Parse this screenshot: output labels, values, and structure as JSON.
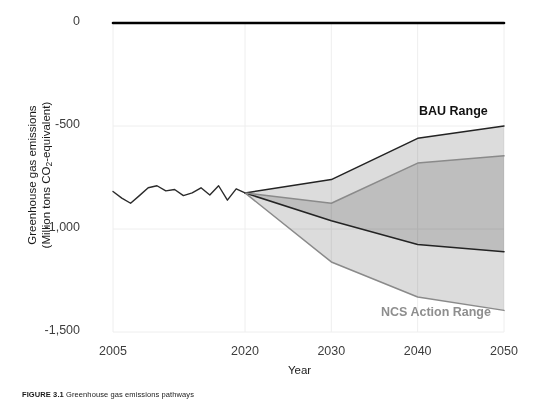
{
  "figure": {
    "caption_label": "FIGURE 3.1",
    "caption_body": " Greenhouse gas emissions pathways",
    "x_axis_title": "Year",
    "y_axis_title_line1": "Greenhouse gas emissions",
    "y_axis_title_line2_pre": "(Million tons CO",
    "y_axis_title_sub": "2",
    "y_axis_title_line2_post": "-equivalent)"
  },
  "colors": {
    "zero_line": "#000000",
    "historical_line": "#2b2b2b",
    "bau_outline": "#232323",
    "ncs_outline": "#8a8a8a",
    "band_light": "#dcdcdc",
    "band_overlap": "#b2b2b2",
    "gridline": "#eeeeee",
    "tick_text": "#3d3d3d",
    "axis_title_text": "#1a1a1a",
    "bau_label_text": "#111111",
    "ncs_label_text": "#8e8e8e"
  },
  "chart_data": {
    "type": "area",
    "title": "",
    "subtitle": "",
    "xlabel": "Year",
    "ylabel": "Greenhouse gas emissions (Million tons CO2-equivalent)",
    "xlim": [
      2005,
      2050
    ],
    "ylim": [
      -1500,
      0
    ],
    "yticks": [
      0,
      -500,
      -1000,
      -1500
    ],
    "ytick_labels": [
      "0",
      "-500",
      "-1,000",
      "-1,500"
    ],
    "xticks": [
      2005,
      2020,
      2030,
      2040,
      2050
    ],
    "xtick_labels": [
      "2005",
      "2020",
      "2030",
      "2040",
      "2050"
    ],
    "grid": true,
    "grid_axis": "both",
    "legend_position": "inline-annotations",
    "annotations": [
      {
        "text": "BAU Range",
        "x": 2042,
        "y": -420,
        "color": "#111111",
        "bold": true
      },
      {
        "text": "NCS Action Range",
        "x": 2038,
        "y": -1390,
        "color": "#8e8e8e",
        "bold": true
      }
    ],
    "series": [
      {
        "name": "Zero reference line",
        "type": "line",
        "color": "#000000",
        "x": [
          2005,
          2050
        ],
        "values": [
          0,
          0
        ]
      },
      {
        "name": "Historical emissions",
        "type": "line",
        "color": "#2b2b2b",
        "x": [
          2005,
          2006,
          2007,
          2008,
          2009,
          2010,
          2011,
          2012,
          2013,
          2014,
          2015,
          2016,
          2017,
          2018,
          2019,
          2020
        ],
        "values": [
          -818,
          -850,
          -875,
          -838,
          -800,
          -790,
          -815,
          -808,
          -838,
          -825,
          -800,
          -835,
          -790,
          -860,
          -805,
          -825
        ]
      },
      {
        "name": "BAU Range upper bound",
        "type": "line",
        "color": "#232323",
        "x": [
          2020,
          2030,
          2040,
          2050
        ],
        "values": [
          -825,
          -760,
          -560,
          -500
        ]
      },
      {
        "name": "BAU Range lower bound",
        "type": "line",
        "color": "#232323",
        "x": [
          2020,
          2030,
          2040,
          2050
        ],
        "values": [
          -825,
          -960,
          -1075,
          -1110
        ]
      },
      {
        "name": "NCS Action Range upper bound",
        "type": "line",
        "color": "#8a8a8a",
        "x": [
          2020,
          2030,
          2040,
          2050
        ],
        "values": [
          -825,
          -875,
          -680,
          -645
        ]
      },
      {
        "name": "NCS Action Range lower bound",
        "type": "line",
        "color": "#8a8a8a",
        "x": [
          2020,
          2030,
          2040,
          2050
        ],
        "values": [
          -825,
          -1160,
          -1330,
          -1395
        ]
      }
    ],
    "bands": [
      {
        "name": "BAU Range",
        "fill": "#dcdcdc",
        "x": [
          2020,
          2030,
          2040,
          2050
        ],
        "upper": [
          -825,
          -760,
          -560,
          -500
        ],
        "lower": [
          -825,
          -960,
          -1075,
          -1110
        ]
      },
      {
        "name": "NCS Action Range",
        "fill": "#dcdcdc",
        "x": [
          2020,
          2030,
          2040,
          2050
        ],
        "upper": [
          -825,
          -875,
          -680,
          -645
        ],
        "lower": [
          -825,
          -1160,
          -1330,
          -1395
        ]
      }
    ]
  }
}
